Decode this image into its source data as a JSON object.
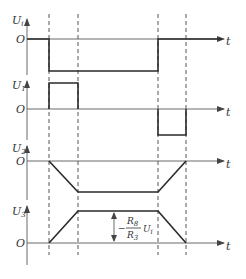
{
  "diagram": {
    "type": "timing-waveforms",
    "panels": [
      {
        "id": "ui",
        "y_label_main": "U",
        "y_label_sub": "i",
        "origin_label": "O",
        "x_label": "t",
        "description": "step down to negative constant at t1, returns to 0 at t3"
      },
      {
        "id": "u1",
        "y_label_main": "U",
        "y_label_sub": "1",
        "origin_label": "O",
        "x_label": "",
        "description": "positive pulse between t1 and t2"
      },
      {
        "id": "u1_neg",
        "x_label": "t",
        "description": "negative pulse between t3 and t4"
      },
      {
        "id": "u2",
        "y_label_main": "U",
        "y_label_sub": "2",
        "origin_label": "O",
        "x_label": "t",
        "description": "ramps down t1-t2, constant, ramps up t3-t4"
      },
      {
        "id": "u3",
        "y_label_main": "U",
        "y_label_sub": "3",
        "origin_label": "O",
        "x_label": "t",
        "description": "ramps up t1-t2, constant, ramps down t3-t4"
      }
    ],
    "annotation": {
      "sign": "−",
      "numerator_main": "R",
      "numerator_sub": "8",
      "denominator_main": "R",
      "denominator_sub": "3",
      "factor_main": "U",
      "factor_sub": "i"
    },
    "colors": {
      "line": "#2a2a2a",
      "axis": "#6a6a6a"
    }
  }
}
